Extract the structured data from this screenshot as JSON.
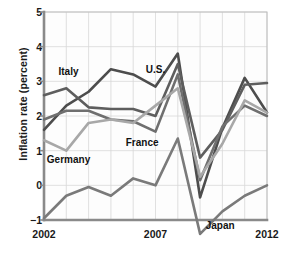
{
  "chart_data": {
    "type": "line",
    "title": "",
    "xlabel": "",
    "ylabel": "Inflation rate (percent)",
    "xlim": [
      2002,
      2012
    ],
    "ylim": [
      -1,
      5
    ],
    "yticks": [
      5,
      4,
      3,
      2,
      1,
      0,
      -1
    ],
    "ytick_labels": [
      "5",
      "4",
      "3",
      "2",
      "1",
      "0",
      "−1"
    ],
    "xticks": [
      2002,
      2007,
      2012
    ],
    "xtick_labels": [
      "2002",
      "2007",
      "2012"
    ],
    "grid": true,
    "legend_position": "inline-annotations",
    "x": [
      2002,
      2003,
      2004,
      2005,
      2006,
      2007,
      2008,
      2009,
      2010,
      2011,
      2012
    ],
    "series": [
      {
        "name": "U.S.",
        "color": "#4d4d4d",
        "label_x": 2007.0,
        "label_y": 3.35,
        "values": [
          1.6,
          2.3,
          2.7,
          3.35,
          3.2,
          2.85,
          3.8,
          -0.35,
          1.65,
          3.1,
          2.1
        ]
      },
      {
        "name": "Italy",
        "color": "#5e5e5e",
        "label_x": 2003.1,
        "label_y": 3.3,
        "values": [
          2.6,
          2.8,
          2.25,
          2.2,
          2.2,
          2.0,
          3.5,
          0.8,
          1.6,
          2.9,
          2.95
        ]
      },
      {
        "name": "France",
        "color": "#6f6f6f",
        "label_x": 2006.4,
        "label_y": 1.25,
        "values": [
          1.9,
          2.15,
          2.15,
          1.9,
          1.85,
          1.55,
          3.2,
          0.15,
          1.7,
          2.3,
          2.0
        ]
      },
      {
        "name": "Germany",
        "color": "#a8a8a8",
        "label_x": 2003.1,
        "label_y": 0.75,
        "values": [
          1.3,
          1.0,
          1.8,
          1.9,
          1.8,
          2.3,
          2.8,
          0.25,
          1.2,
          2.45,
          2.1
        ]
      },
      {
        "name": "Japan",
        "color": "#7a7a7a",
        "label_x": 2009.9,
        "label_y": -1.15,
        "values": [
          -0.95,
          -0.3,
          -0.05,
          -0.3,
          0.2,
          0.0,
          1.35,
          -1.4,
          -0.75,
          -0.3,
          0.0
        ]
      }
    ]
  },
  "style": {
    "axis_color": "#8a8a8a",
    "grid_color": "#d8d8d8",
    "text_color": "#1a1a1a",
    "background": "#ffffff"
  }
}
